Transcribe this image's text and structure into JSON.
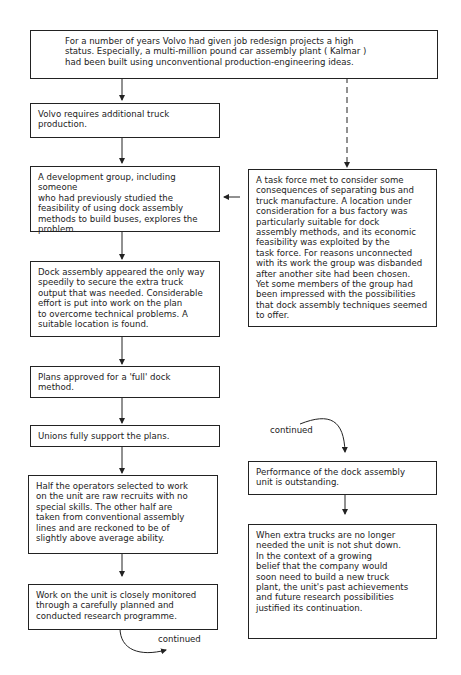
{
  "diagram": {
    "type": "flowchart",
    "boxes": [
      {
        "id": "b0",
        "text": "For a number of years Volvo had given job redesign projects a high\nstatus. Especially, a multi-million pound car assembly plant ( Kalmar )\nhad been built using unconventional production-engineering ideas."
      },
      {
        "id": "b1",
        "text": "Volvo requires additional truck\nproduction."
      },
      {
        "id": "b2",
        "text": "A development group, including someone\nwho had previously studied the\nfeasibility of using dock assembly\nmethods to build buses, explores the\nproblem."
      },
      {
        "id": "b3",
        "text": "Dock assembly appeared the only way\nspeedily to secure the extra truck\noutput that was needed. Considerable\neffort is put into work on the plan\nto overcome technical problems. A\nsuitable location is found."
      },
      {
        "id": "b4",
        "text": "Plans approved for a 'full' dock\nmethod."
      },
      {
        "id": "b5",
        "text": "Unions fully support the plans."
      },
      {
        "id": "b6",
        "text": "Half the operators selected to work\non the unit are raw recruits with no\nspecial skills. The other half are\ntaken from conventional assembly\nlines and are reckoned to be of\nslightly above average ability."
      },
      {
        "id": "b7",
        "text": "Work on the unit is closely monitored\nthrough a carefully planned and\nconducted research programme."
      },
      {
        "id": "r1",
        "text": "A task force met to consider some\nconsequences of separating bus and\ntruck manufacture. A location under\nconsideration for a bus factory was\nparticularly suitable for dock\nassembly methods, and its economic\nfeasibility was exploited by the\ntask force. For reasons unconnected\nwith its work the group was disbanded\nafter another site had been chosen.\nYet some members of the group had\nbeen impressed with the possibilities\nthat dock assembly techniques seemed\nto offer."
      },
      {
        "id": "r2",
        "text": "Performance of the dock assembly\nunit is outstanding."
      },
      {
        "id": "r3",
        "text": "When extra trucks are no longer\nneeded the unit is not shut down.\nIn the context of a growing\nbelief that the company would\nsoon need to build a new truck\nplant, the unit's past achievements\nand future research possibilities\njustified its continuation."
      }
    ],
    "labels": {
      "continued_bottom": "continued",
      "continued_top": "continued"
    },
    "edges": [
      {
        "from": "b0",
        "to": "b1",
        "style": "solid"
      },
      {
        "from": "b0",
        "to": "r1",
        "style": "dashed"
      },
      {
        "from": "b1",
        "to": "b2",
        "style": "solid"
      },
      {
        "from": "r1",
        "to": "b2",
        "style": "solid"
      },
      {
        "from": "b2",
        "to": "b3",
        "style": "solid"
      },
      {
        "from": "b3",
        "to": "b4",
        "style": "solid"
      },
      {
        "from": "b4",
        "to": "b5",
        "style": "solid"
      },
      {
        "from": "b5",
        "to": "b6",
        "style": "solid"
      },
      {
        "from": "b6",
        "to": "b7",
        "style": "solid"
      },
      {
        "from": "b7",
        "to": "continued",
        "style": "curved"
      },
      {
        "from": "continued",
        "to": "r2",
        "style": "curved"
      },
      {
        "from": "r2",
        "to": "r3",
        "style": "solid"
      }
    ]
  }
}
